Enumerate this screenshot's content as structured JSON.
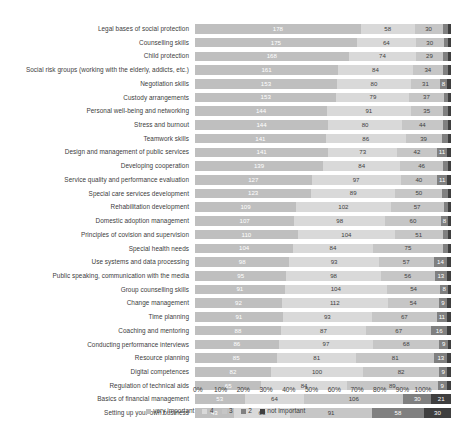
{
  "chart_data": {
    "type": "bar",
    "subtype": "horizontal-stacked-100",
    "title": "",
    "subtitle": "",
    "xlabel": "",
    "ylabel": "",
    "xlim": [
      0,
      100
    ],
    "xticks": [
      "0%",
      "10%",
      "20%",
      "30%",
      "40%",
      "50%",
      "60%",
      "70%",
      "80%",
      "90%",
      "100%"
    ],
    "grid": false,
    "legend_position": "bottom",
    "value_unit": "respondents",
    "legend": [
      "very important",
      "4",
      "3",
      "2",
      "not important"
    ],
    "series_colors": [
      "#bfbfbf",
      "#d9d9d9",
      "#c6c6c6",
      "#808080",
      "#3f3f3f"
    ],
    "categories": [
      "Legal bases of social protection",
      "Counselling skills",
      "Child protection",
      "Social risk groups (working with the elderly, addicts, etc.)",
      "Negotiation skills",
      "Custody arrangements",
      "Personal well-being and networking",
      "Stress and burnout",
      "Teamwork skills",
      "Design and management of public services",
      "Developing cooperation",
      "Service quality and performance evaluation",
      "Special care services development",
      "Rehabilitation development",
      "Domestic adoption management",
      "Principles of covision and supervision",
      "Special health needs",
      "Use systems and data processing",
      "Public speaking, communication with the media",
      "Group counselling skills",
      "Change management",
      "Time planning",
      "Coaching and mentoring",
      "Conducting performance interviews",
      "Resource planning",
      "Digital competences",
      "Regulation of technical aids",
      "Basics of  financial management",
      "Setting up your own business"
    ],
    "series": [
      {
        "name": "very important",
        "values": [
          178,
          175,
          168,
          161,
          153,
          153,
          144,
          144,
          141,
          141,
          139,
          127,
          123,
          109,
          107,
          110,
          104,
          98,
          95,
          91,
          92,
          91,
          88,
          86,
          85,
          82,
          65,
          53,
          43
        ]
      },
      {
        "name": "4",
        "values": [
          58,
          64,
          74,
          84,
          80,
          79,
          91,
          80,
          86,
          73,
          84,
          97,
          89,
          102,
          98,
          104,
          84,
          93,
          98,
          104,
          112,
          93,
          87,
          97,
          81,
          100,
          84,
          64,
          63
        ]
      },
      {
        "name": "3",
        "values": [
          30,
          30,
          29,
          34,
          31,
          37,
          35,
          44,
          39,
          42,
          46,
          40,
          50,
          57,
          60,
          51,
          75,
          57,
          56,
          54,
          54,
          67,
          67,
          68,
          81,
          82,
          89,
          106,
          91
        ]
      },
      {
        "name": "2",
        "values": [
          6,
          5,
          6,
          6,
          8,
          5,
          6,
          6,
          7,
          11,
          6,
          11,
          6,
          5,
          8,
          6,
          5,
          14,
          13,
          8,
          9,
          11,
          16,
          9,
          13,
          9,
          9,
          30,
          58
        ]
      },
      {
        "name": "not important",
        "values": [
          3,
          3,
          3,
          3,
          4,
          3,
          3,
          3,
          3,
          4,
          3,
          4,
          3,
          3,
          3,
          3,
          3,
          4,
          4,
          3,
          4,
          4,
          4,
          3,
          4,
          4,
          4,
          21,
          30
        ]
      }
    ],
    "visible_labels": {
      "note": "Labels drawn inside segments; tiny segments render without a visible number.",
      "min_width_for_label_pct": 2.6
    }
  }
}
